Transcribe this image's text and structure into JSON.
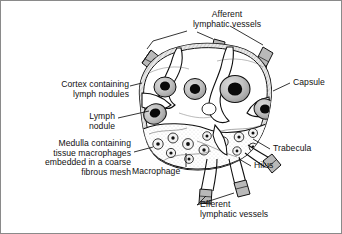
{
  "figure": {
    "background_color": "#ffffff",
    "ink_color": "#111111",
    "border_color": "#8a8a8a"
  },
  "labels": {
    "afferent": "Afferent\nlymphatic vessels",
    "cortex": "Cortex containing\nlymph nodules",
    "lymph_nodule": "Lymph\nnodule",
    "medulla": "Medulla containing\ntissue macrophages\nembedded in a coarse\nfibrous mesh",
    "macrophage": "Macrophage",
    "capsule": "Capsule",
    "trabecula": "Trabecula",
    "hilus": "Hilus",
    "efferent": "Efferent\nlymphatic vessels"
  },
  "diagram_parts": {
    "capsule": "outer fibrous capsule of the node",
    "cortex": "outer cortex region with lymph nodules",
    "nodules": "dark germinal centres inside lymph nodules",
    "medulla": "inner stippled medulla with macrophages",
    "trabeculae": "connective tissue partitions extending inward",
    "hilus": "indentation where efferent vessels exit",
    "afferent_vessel_count": 3,
    "efferent_vessel_count": 3,
    "nodule_count": 6
  }
}
